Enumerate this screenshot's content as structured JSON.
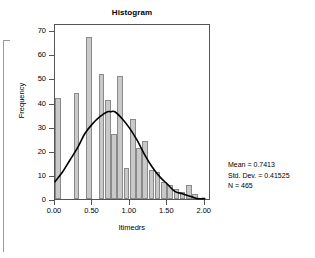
{
  "chart_data": {
    "type": "bar",
    "title": "Histogram",
    "xlabel": "ltimedrs",
    "ylabel": "Frequency",
    "grid": false,
    "legend_position": "none",
    "xlim": [
      0.0,
      2.0833
    ],
    "ylim": [
      0,
      73
    ],
    "xticks": [
      "0.00",
      "0.50",
      "1.00",
      "1.50",
      "2.00"
    ],
    "xtick_values": [
      0.0,
      0.5,
      1.0,
      1.5,
      2.0
    ],
    "yticks": [
      "0",
      "10",
      "20",
      "30",
      "40",
      "50",
      "60",
      "70"
    ],
    "ytick_values": [
      0,
      10,
      20,
      30,
      40,
      50,
      60,
      70
    ],
    "bin_width": 0.0833,
    "bins": [
      {
        "x0": 0.0,
        "x1": 0.0833,
        "value": 42
      },
      {
        "x0": 0.0833,
        "x1": 0.1667,
        "value": 0
      },
      {
        "x0": 0.1667,
        "x1": 0.25,
        "value": 0
      },
      {
        "x0": 0.25,
        "x1": 0.3333,
        "value": 44
      },
      {
        "x0": 0.3333,
        "x1": 0.4167,
        "value": 0
      },
      {
        "x0": 0.4167,
        "x1": 0.5,
        "value": 67
      },
      {
        "x0": 0.5,
        "x1": 0.5833,
        "value": 0
      },
      {
        "x0": 0.5833,
        "x1": 0.6667,
        "value": 52
      },
      {
        "x0": 0.6667,
        "x1": 0.75,
        "value": 41
      },
      {
        "x0": 0.75,
        "x1": 0.8333,
        "value": 27
      },
      {
        "x0": 0.8333,
        "x1": 0.9167,
        "value": 51
      },
      {
        "x0": 0.9167,
        "x1": 1.0,
        "value": 13
      },
      {
        "x0": 1.0,
        "x1": 1.0833,
        "value": 33
      },
      {
        "x0": 1.0833,
        "x1": 1.1667,
        "value": 21
      },
      {
        "x0": 1.1667,
        "x1": 1.25,
        "value": 24
      },
      {
        "x0": 1.25,
        "x1": 1.3333,
        "value": 12
      },
      {
        "x0": 1.3333,
        "x1": 1.4167,
        "value": 11
      },
      {
        "x0": 1.4167,
        "x1": 1.5,
        "value": 7
      },
      {
        "x0": 1.5,
        "x1": 1.5833,
        "value": 6
      },
      {
        "x0": 1.5833,
        "x1": 1.6667,
        "value": 4
      },
      {
        "x0": 1.6667,
        "x1": 1.75,
        "value": 3
      },
      {
        "x0": 1.75,
        "x1": 1.8333,
        "value": 6
      },
      {
        "x0": 1.8333,
        "x1": 1.9167,
        "value": 2
      },
      {
        "x0": 1.9167,
        "x1": 2.0,
        "value": 0
      }
    ],
    "normal_curve": {
      "label": "normal distribution overlay",
      "mean": 0.7413,
      "std_dev": 0.41525,
      "peak_value": 37,
      "points": [
        {
          "x": 0.0,
          "y": 8
        },
        {
          "x": 0.1,
          "y": 12
        },
        {
          "x": 0.2,
          "y": 17
        },
        {
          "x": 0.3,
          "y": 22
        },
        {
          "x": 0.4,
          "y": 28
        },
        {
          "x": 0.5,
          "y": 32
        },
        {
          "x": 0.6,
          "y": 35
        },
        {
          "x": 0.7,
          "y": 37
        },
        {
          "x": 0.7413,
          "y": 37
        },
        {
          "x": 0.8,
          "y": 37
        },
        {
          "x": 0.9,
          "y": 34
        },
        {
          "x": 1.0,
          "y": 30
        },
        {
          "x": 1.1,
          "y": 25
        },
        {
          "x": 1.2,
          "y": 19
        },
        {
          "x": 1.3,
          "y": 14
        },
        {
          "x": 1.4,
          "y": 10
        },
        {
          "x": 1.5,
          "y": 7
        },
        {
          "x": 1.6,
          "y": 4
        },
        {
          "x": 1.7,
          "y": 3
        },
        {
          "x": 1.8,
          "y": 2
        },
        {
          "x": 1.9,
          "y": 1
        },
        {
          "x": 2.0,
          "y": 1
        }
      ]
    },
    "statistics": {
      "mean_line": "Mean = 0.7413",
      "std_dev_line": "Std. Dev. = 0.41525",
      "n_line": "N = 465",
      "mean": 0.7413,
      "std_dev": 0.41525,
      "n": 465
    },
    "colors": {
      "bar_fill": "#c9c9c9",
      "bar_border": "#8a8a8a",
      "curve": "#000000",
      "frame": "#555555",
      "background": "#ffffff",
      "text": "#000000"
    }
  }
}
